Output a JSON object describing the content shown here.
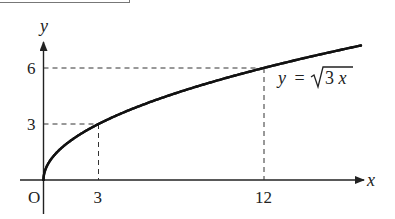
{
  "chart_data": {
    "type": "line",
    "title": "",
    "function": "y = sqrt(3x)",
    "xlabel": "x",
    "ylabel": "y",
    "origin_label": "O",
    "x_ticks": [
      3,
      12
    ],
    "y_ticks": [
      3,
      6
    ],
    "series": [
      {
        "name": "y = √3x",
        "x": [
          0,
          0.25,
          1,
          2,
          3,
          5,
          8,
          12,
          15,
          17.3
        ],
        "y": [
          0,
          0.87,
          1.73,
          2.45,
          3,
          3.87,
          4.9,
          6,
          6.71,
          7.2
        ]
      }
    ],
    "annotations": [
      {
        "point": [
          3,
          3
        ],
        "style": "dashed guide lines to both axes"
      },
      {
        "point": [
          12,
          6
        ],
        "style": "dashed guide lines to both axes"
      },
      {
        "text": "y = √3x",
        "position": "below curve near x=12"
      }
    ],
    "xlim": [
      0,
      17.5
    ],
    "ylim": [
      0,
      7.3
    ],
    "grid": false,
    "legend": "none"
  },
  "labels": {
    "x_axis": "x",
    "y_axis": "y",
    "origin": "O",
    "x_tick_3": "3",
    "x_tick_12": "12",
    "y_tick_3": "3",
    "y_tick_6": "6",
    "curve_y": "y",
    "curve_eq": "=",
    "curve_radicand_num": "3",
    "curve_radicand_var": "x"
  },
  "colors": {
    "ink": "#222222",
    "frame": "#777777",
    "background": "#ffffff"
  }
}
